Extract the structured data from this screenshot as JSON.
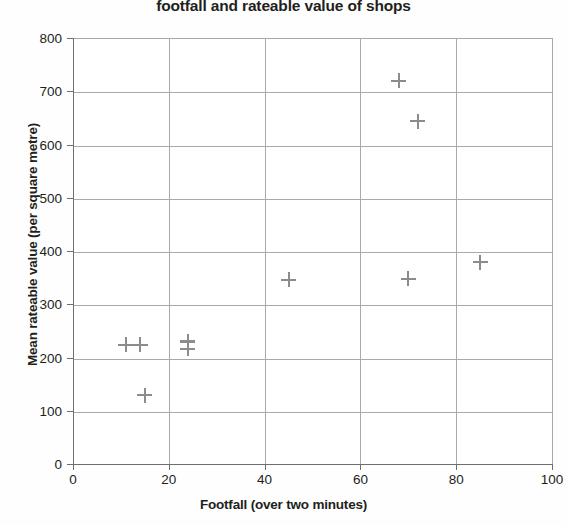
{
  "chart_data": {
    "type": "scatter",
    "title": "footfall and rateable value of shops",
    "xlabel": "Footfall (over two minutes)",
    "ylabel": "Mean rateable value (per square metre)",
    "xlim": [
      0,
      100
    ],
    "ylim": [
      0,
      800
    ],
    "xticks": [
      0,
      20,
      40,
      60,
      80,
      100
    ],
    "yticks": [
      0,
      100,
      200,
      300,
      400,
      500,
      600,
      700,
      800
    ],
    "grid": true,
    "legend": false,
    "marker": "plus",
    "marker_color": "#8c8c8c",
    "series": [
      {
        "name": "shops",
        "points": [
          {
            "x": 11,
            "y": 226
          },
          {
            "x": 14,
            "y": 226
          },
          {
            "x": 15,
            "y": 131
          },
          {
            "x": 24,
            "y": 232
          },
          {
            "x": 24,
            "y": 218
          },
          {
            "x": 45,
            "y": 348
          },
          {
            "x": 68,
            "y": 722
          },
          {
            "x": 70,
            "y": 350
          },
          {
            "x": 72,
            "y": 646
          },
          {
            "x": 85,
            "y": 381
          }
        ]
      }
    ]
  },
  "axes": {
    "x_tick_labels": [
      "0",
      "20",
      "40",
      "60",
      "80",
      "100"
    ],
    "y_tick_labels": [
      "0",
      "100",
      "200",
      "300",
      "400",
      "500",
      "600",
      "700",
      "800"
    ]
  }
}
